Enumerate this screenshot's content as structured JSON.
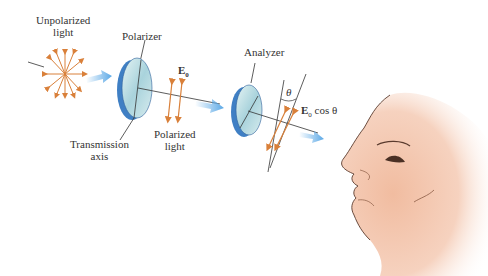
{
  "labels": {
    "unpolarized_line1": "Unpolarized",
    "unpolarized_line2": "light",
    "polarizer": "Polarizer",
    "transmission_line1": "Transmission",
    "transmission_line2": "axis",
    "polarized_line1": "Polarized",
    "polarized_line2": "light",
    "analyzer": "Analyzer",
    "e0": "E",
    "e0_sub": "0",
    "theta": "θ",
    "e0cos_E": "E",
    "e0cos_sub": "0",
    "e0cos_rest": " cos θ"
  },
  "colors": {
    "arrow_orange": "#d9803a",
    "beam_blue": "#5aa8e6",
    "disk_edge": "#3f7fc4",
    "disk_face": "#bfe0e6",
    "skin": "#f4c7ab",
    "line": "#333333"
  }
}
